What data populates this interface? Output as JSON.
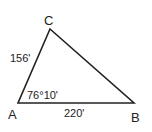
{
  "diagram": {
    "type": "triangle",
    "vertices": {
      "A": {
        "label": "A"
      },
      "B": {
        "label": "B"
      },
      "C": {
        "label": "C"
      }
    },
    "sides": {
      "AC": {
        "label": "156'"
      },
      "AB": {
        "label": "220'"
      }
    },
    "angles": {
      "A": {
        "label": "76°10'"
      }
    },
    "stroke_color": "#222222"
  }
}
